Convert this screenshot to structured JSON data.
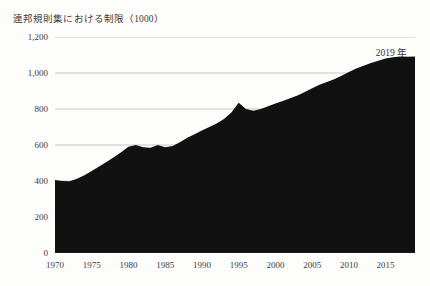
{
  "chart_data": {
    "type": "area",
    "title": "連邦規則集における制限（1000）",
    "xlabel": "",
    "ylabel": "",
    "xlim": [
      1970,
      2019
    ],
    "ylim": [
      0,
      1200
    ],
    "grid": true,
    "legend_position": "none",
    "fill_color": "#111111",
    "gridline_color": "#b9b9b9",
    "axis_color": "#2b2b2b",
    "annotations": [
      {
        "text": "2019 年",
        "x": 2016,
        "y": 1160
      }
    ],
    "y_ticks": [
      0,
      200,
      400,
      600,
      800,
      1000,
      1200
    ],
    "y_tick_labels": [
      "0",
      "200",
      "400",
      "600",
      "800",
      "1,000",
      "1,200"
    ],
    "x_ticks": [
      1970,
      1975,
      1980,
      1985,
      1990,
      1995,
      2000,
      2005,
      2010,
      2015
    ],
    "x_tick_labels": [
      "1970",
      "1975",
      "1980",
      "1985",
      "1990",
      "1995",
      "2000",
      "2005",
      "2010",
      "2015"
    ],
    "x": [
      1970,
      1971,
      1972,
      1973,
      1974,
      1975,
      1976,
      1977,
      1978,
      1979,
      1980,
      1981,
      1982,
      1983,
      1984,
      1985,
      1986,
      1987,
      1988,
      1989,
      1990,
      1991,
      1992,
      1993,
      1994,
      1995,
      1996,
      1997,
      1998,
      1999,
      2000,
      2001,
      2002,
      2003,
      2004,
      2005,
      2006,
      2007,
      2008,
      2009,
      2010,
      2011,
      2012,
      2013,
      2014,
      2015,
      2016,
      2017,
      2018,
      2019
    ],
    "values": [
      405,
      400,
      398,
      412,
      432,
      455,
      480,
      505,
      532,
      560,
      590,
      600,
      588,
      585,
      600,
      588,
      595,
      615,
      640,
      660,
      680,
      700,
      720,
      745,
      780,
      835,
      800,
      790,
      800,
      815,
      830,
      845,
      860,
      875,
      895,
      915,
      935,
      950,
      965,
      985,
      1005,
      1025,
      1040,
      1055,
      1068,
      1080,
      1088,
      1092,
      1090,
      1092
    ],
    "series": [
      {
        "name": "連邦規則集における制限（1000）",
        "values": [
          405,
          400,
          398,
          412,
          432,
          455,
          480,
          505,
          532,
          560,
          590,
          600,
          588,
          585,
          600,
          588,
          595,
          615,
          640,
          660,
          680,
          700,
          720,
          745,
          780,
          835,
          800,
          790,
          800,
          815,
          830,
          845,
          860,
          875,
          895,
          915,
          935,
          950,
          965,
          985,
          1005,
          1025,
          1040,
          1055,
          1068,
          1080,
          1088,
          1092,
          1090,
          1092
        ]
      }
    ]
  }
}
